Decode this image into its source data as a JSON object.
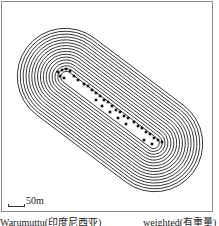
{
  "figure": {
    "type": "contour map",
    "scale_bar": {
      "label": "50m"
    },
    "caption": {
      "left": "Warumuttu(印度尼西亚)",
      "right": "weighted(有重量)"
    },
    "contours": {
      "center": [
        110,
        110
      ],
      "angle_deg": 37,
      "count": 16,
      "outer_half_length": 104,
      "outer_half_width": 48,
      "color": "#1a1a1a"
    }
  }
}
